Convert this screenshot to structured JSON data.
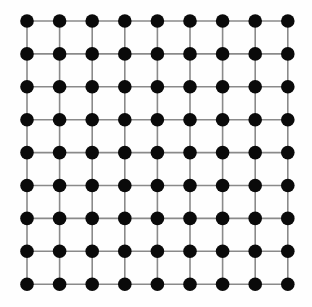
{
  "figure": {
    "background_color": "#fefefe",
    "width": 312,
    "height": 307
  },
  "chart_data": {
    "type": "scatter",
    "title": "",
    "subtitle": "",
    "xlabel": "",
    "ylabel": "",
    "grid": false,
    "legend": null,
    "graph_kind": "square-lattice",
    "rows": 9,
    "columns": 9,
    "node_count": 81,
    "edge_count": 144,
    "node_color": "#0a0a0a",
    "node_radius_px": 6.8,
    "edge_color": "#8a8a8a",
    "edge_width_px": 1.6,
    "origin_x_px": 27,
    "origin_y_px": 21,
    "spacing_x_px": 32.6,
    "spacing_y_px": 32.9,
    "x": [
      27,
      59.6,
      92.2,
      124.8,
      157.4,
      190,
      222.6,
      255.2,
      287.8
    ],
    "y": [
      21,
      53.9,
      86.8,
      119.7,
      152.6,
      185.5,
      218.4,
      251.3,
      284.2
    ],
    "xlim": [
      0,
      312
    ],
    "ylim": [
      0,
      307
    ]
  }
}
